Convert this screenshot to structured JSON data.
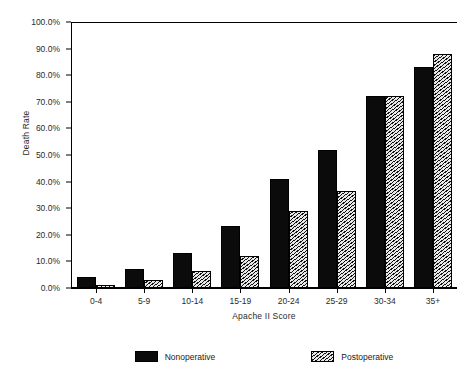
{
  "chart_data": {
    "type": "bar",
    "title": "",
    "xlabel": "Apache II Score",
    "ylabel": "Death Rate",
    "categories": [
      "0-4",
      "5-9",
      "10-14",
      "15-19",
      "20-24",
      "25-29",
      "30-34",
      "35+"
    ],
    "series": [
      {
        "name": "Nonoperative",
        "color": "#0b0b0b",
        "pattern": "solid",
        "values": [
          4.0,
          7.0,
          13.0,
          23.5,
          41.0,
          52.0,
          72.0,
          83.0
        ]
      },
      {
        "name": "Postoperative",
        "color": "#cfcfcf",
        "pattern": "diagonal-hatch",
        "values": [
          1.0,
          3.0,
          6.5,
          12.0,
          29.0,
          36.5,
          72.0,
          88.0
        ]
      }
    ],
    "ylim": [
      0,
      100
    ],
    "ytick_values": [
      100,
      90,
      80,
      70,
      60,
      50,
      40,
      30,
      20,
      10,
      0
    ],
    "ytick_labels": [
      "100.0%",
      "90.0%",
      "80.0%",
      "70.0%",
      "60.0%",
      "50.0%",
      "40.0%",
      "30.0%",
      "20.0%",
      "10.0%",
      "0.0%"
    ],
    "grid": false,
    "legend_position": "bottom"
  }
}
